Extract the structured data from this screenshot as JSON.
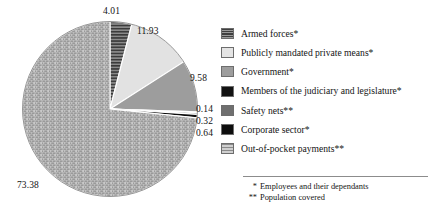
{
  "chart_data": {
    "type": "pie",
    "title": "",
    "subtitle": "",
    "xlabel": "",
    "ylabel": "",
    "legend_position": "right",
    "grid": false,
    "units": "percent",
    "start_angle_deg": 0,
    "direction": "clockwise",
    "total": 100.0,
    "categories": [
      "Armed forces*",
      "Publicly mandated private means*",
      "Government*",
      "Members of the judiciary and legislature*",
      "Safety nets**",
      "Corporate sector*",
      "Out-of-pocket payments**"
    ],
    "values": [
      4.01,
      11.93,
      9.58,
      0.14,
      0.32,
      0.64,
      73.38
    ],
    "value_labels": [
      "4.01",
      "11.93",
      "9.58",
      "0.14",
      "0.32",
      "0.64",
      "73.38"
    ],
    "slices": [
      {
        "label": "Armed forces*",
        "value": 4.01,
        "value_label": "4.01",
        "fill": "#6b6b6b",
        "pattern": "horizontal-stripes",
        "start_deg": 0.0,
        "end_deg": 14.436
      },
      {
        "label": "Publicly mandated private means*",
        "value": 11.93,
        "value_label": "11.93",
        "fill": "#e2e2e2",
        "pattern": "solid",
        "start_deg": 14.436,
        "end_deg": 57.384
      },
      {
        "label": "Government*",
        "value": 9.58,
        "value_label": "9.58",
        "fill": "#9d9d9d",
        "pattern": "solid",
        "start_deg": 57.384,
        "end_deg": 91.872
      },
      {
        "label": "Members of the judiciary and legislature*",
        "value": 0.14,
        "value_label": "0.14",
        "fill": "#121212",
        "pattern": "solid",
        "start_deg": 91.872,
        "end_deg": 92.376
      },
      {
        "label": "Safety nets**",
        "value": 0.32,
        "value_label": "0.32",
        "fill": "#6f6f6f",
        "pattern": "solid",
        "start_deg": 92.376,
        "end_deg": 93.528
      },
      {
        "label": "Corporate sector*",
        "value": 0.64,
        "value_label": "0.64",
        "fill": "#0d0d0d",
        "pattern": "solid",
        "start_deg": 93.528,
        "end_deg": 95.832
      },
      {
        "label": "Out-of-pocket payments**",
        "value": 73.38,
        "value_label": "73.38",
        "fill": "#b3b3b3",
        "pattern": "brick-dash",
        "start_deg": 95.832,
        "end_deg": 360.0
      }
    ]
  },
  "legend": {
    "items": [
      {
        "label": "Armed forces*",
        "swatch": "horizontal-stripes",
        "color": "#6b6b6b"
      },
      {
        "label": "Publicly mandated private means*",
        "swatch": "solid",
        "color": "#e4e4e4"
      },
      {
        "label": "Government*",
        "swatch": "solid",
        "color": "#9d9d9d"
      },
      {
        "label": "Members of the judiciary and legislature*",
        "swatch": "solid",
        "color": "#121212"
      },
      {
        "label": "Safety nets**",
        "swatch": "solid",
        "color": "#6f6f6f"
      },
      {
        "label": "Corporate sector*",
        "swatch": "solid",
        "color": "#0d0d0d"
      },
      {
        "label": "Out-of-pocket payments**",
        "swatch": "brick-dash",
        "color": "#b3b3b3"
      }
    ]
  },
  "footnotes": [
    {
      "mark": "*",
      "text": "Employees and their dependants"
    },
    {
      "mark": "**",
      "text": "Population covered"
    }
  ]
}
